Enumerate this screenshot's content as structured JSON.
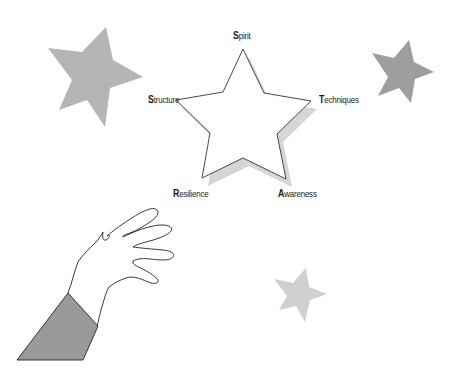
{
  "diagram": {
    "center_star": {
      "fill": "#ffffff",
      "stroke": "#333333",
      "shadow": "#d6d6d6",
      "points": "243,49 264,93 311,101 277,134 286,179 243,158 202,178 210,133 176,100 223,92",
      "shadow_points": "249,57 270,101 317,109 283,142 292,187 249,166 208,186 216,141 182,108 229,100"
    },
    "labels": [
      {
        "id": "spirit",
        "first": "S",
        "rest": "pirit",
        "x": 233,
        "y": 31
      },
      {
        "id": "structure",
        "first": "S",
        "rest": "tructure",
        "x": 148,
        "y": 95
      },
      {
        "id": "techniques",
        "first": "T",
        "rest": "echniques",
        "x": 319,
        "y": 95
      },
      {
        "id": "resilience",
        "first": "R",
        "rest": "esilience",
        "x": 173,
        "y": 189
      },
      {
        "id": "awareness",
        "first": "A",
        "rest": "wareness",
        "x": 278,
        "y": 189
      }
    ],
    "decorative_stars": [
      {
        "id": "star-top-left",
        "fill": "#b5b5b5",
        "points": "106,27 113,60 143,77 110,88 105,127 87,100 59,110 72,80 48,48 82,52"
      },
      {
        "id": "star-top-right",
        "fill": "#9e9e9e",
        "points": "409,40 414,62 434,72 415,79 411,103 399,88 378,96 388,77 372,53 394,58"
      },
      {
        "id": "star-bottom",
        "fill": "#cfcfcf",
        "points": "306,268 309,287 327,294 310,300 305,322 296,306 279,310 287,296 274,279 293,283"
      }
    ],
    "hand": {
      "skin_fill": "#ffffff",
      "outline": "#222222",
      "sleeve_fill": "#9a9a9a",
      "sleeve_points": "68,293 98,326 83,360 17,360"
    }
  }
}
